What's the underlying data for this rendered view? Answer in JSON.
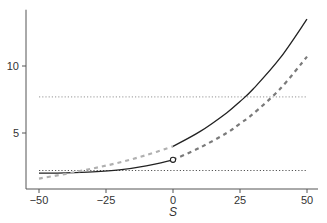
{
  "chart_data": {
    "type": "line",
    "title": "",
    "xlabel": "S",
    "ylabel": "",
    "xlim": [
      -52,
      52
    ],
    "ylim": [
      0.8,
      14.2
    ],
    "grid": false,
    "legend": null,
    "x_ticks": [
      -50,
      -25,
      0,
      25,
      50
    ],
    "x_tick_labels": [
      "-50",
      "-25",
      "0",
      "25",
      "50"
    ],
    "y_ticks": [
      5,
      10
    ],
    "y_tick_labels": [
      "5",
      "10"
    ],
    "series": [
      {
        "name": "solid-left-branch",
        "style": "solid",
        "color": "#222222",
        "x": [
          -50,
          -40,
          -30,
          -20,
          -10,
          0
        ],
        "y": [
          2.0,
          2.03,
          2.1,
          2.25,
          2.55,
          3.0
        ]
      },
      {
        "name": "solid-right-branch",
        "style": "solid",
        "color": "#222222",
        "x": [
          0,
          10,
          20,
          25,
          30,
          40,
          50
        ],
        "y": [
          4.0,
          5.1,
          6.5,
          7.35,
          8.3,
          10.6,
          13.5
        ]
      },
      {
        "name": "light-dashed-left",
        "style": "dashed",
        "color": "#b0b0b0",
        "x": [
          -50,
          -40,
          -30,
          -20,
          -10,
          0
        ],
        "y": [
          1.6,
          1.95,
          2.35,
          2.8,
          3.35,
          4.0
        ]
      },
      {
        "name": "dark-dashed-right",
        "style": "dashed",
        "color": "#7a7a7a",
        "x": [
          0,
          10,
          20,
          25,
          30,
          40,
          50
        ],
        "y": [
          3.0,
          3.9,
          5.0,
          5.7,
          6.45,
          8.3,
          10.7
        ]
      },
      {
        "name": "upper-dotted-reference",
        "style": "dotted",
        "color": "#aaaaaa",
        "x": [
          -50,
          50
        ],
        "y": [
          7.7,
          7.7
        ]
      },
      {
        "name": "lower-dotted-reference",
        "style": "dotted",
        "color": "#555555",
        "x": [
          -50,
          50
        ],
        "y": [
          2.2,
          2.2
        ]
      }
    ],
    "annotations": [
      {
        "type": "open-circle",
        "x": 0,
        "y": 3.0
      }
    ]
  },
  "axes": {
    "x_title": "S",
    "x_tick_labels": [
      "-50",
      "-25",
      "0",
      "25",
      "50"
    ],
    "y_tick_labels": [
      "5",
      "10"
    ]
  }
}
